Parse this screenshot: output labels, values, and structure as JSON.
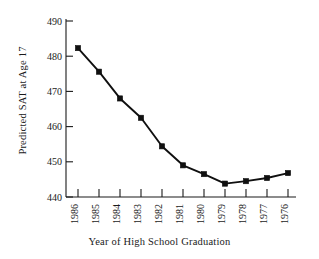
{
  "chart_data": {
    "type": "line",
    "title": "",
    "xlabel": "Year of High School Graduation",
    "ylabel": "Predicted SAT at Age 17",
    "categories": [
      "1986",
      "1985",
      "1984",
      "1983",
      "1982",
      "1981",
      "1980",
      "1979",
      "1978",
      "1977",
      "1976"
    ],
    "values": [
      482.3,
      475.6,
      468.0,
      462.5,
      454.4,
      449.0,
      446.5,
      443.8,
      444.5,
      445.4,
      446.8
    ],
    "series": [
      {
        "name": "Predicted SAT at Age 17",
        "values": [
          482.3,
          475.6,
          468.0,
          462.5,
          454.4,
          449.0,
          446.5,
          443.8,
          444.5,
          445.4,
          446.8
        ]
      }
    ],
    "ylim": [
      440,
      492
    ],
    "yticks": [
      440,
      450,
      460,
      470,
      480,
      490
    ],
    "ytick_labels": [
      "440",
      "450",
      "460",
      "470",
      "480",
      "490"
    ],
    "xtick_labels": [
      "1986",
      "1985",
      "1984",
      "1983",
      "1982",
      "1981",
      "1980",
      "1979",
      "1978",
      "1977",
      "1976"
    ],
    "grid": false,
    "legend": "none",
    "marker": "filled-square",
    "line_color": "#101010",
    "marker_color": "#101010",
    "axis_color": "#1a1a1a",
    "background_color": "#ffffff"
  },
  "axis": {
    "ylabel": "Predicted SAT at Age 17",
    "xlabel": "Year of High School Graduation"
  }
}
